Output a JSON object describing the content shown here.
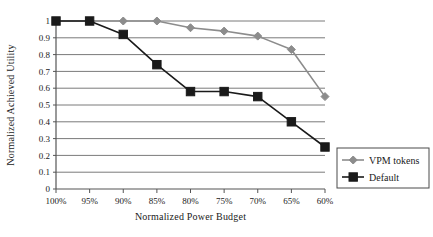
{
  "chart_data": {
    "type": "line",
    "title": "",
    "xlabel": "Normalized Power Budget",
    "ylabel": "Normalized Achieved Utility",
    "categories": [
      "100%",
      "95%",
      "90%",
      "85%",
      "80%",
      "75%",
      "70%",
      "65%",
      "60%"
    ],
    "ylim": [
      0,
      1
    ],
    "yticks": [
      "0",
      "0.1",
      "0.2",
      "0.3",
      "0.4",
      "0.5",
      "0.6",
      "0.7",
      "0.8",
      "0.9",
      "1"
    ],
    "ytick_values": [
      0,
      0.1,
      0.2,
      0.3,
      0.4,
      0.5,
      0.6,
      0.7,
      0.8,
      0.9,
      1
    ],
    "grid": "horizontal",
    "legend_position": "right-bottom",
    "series": [
      {
        "name": "VPM tokens",
        "color": "#8c8c8c",
        "marker": "diamond",
        "values": [
          1.0,
          1.0,
          1.0,
          1.0,
          0.96,
          0.94,
          0.91,
          0.83,
          0.55
        ]
      },
      {
        "name": "Default",
        "color": "#1a1a1a",
        "marker": "square",
        "values": [
          1.0,
          1.0,
          0.92,
          0.74,
          0.58,
          0.58,
          0.55,
          0.4,
          0.25
        ]
      }
    ]
  },
  "legend": {
    "items": [
      {
        "label": "VPM tokens"
      },
      {
        "label": "Default"
      }
    ]
  },
  "colors": {
    "vpm_tokens": "#8c8c8c",
    "default": "#1a1a1a",
    "gridline": "#7a7a7a",
    "axis": "#555555",
    "background": "#ffffff"
  }
}
